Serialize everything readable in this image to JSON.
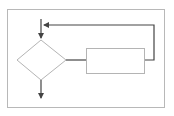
{
  "diagram": {
    "type": "flowchart-loop",
    "colors": {
      "background": "#ffffff",
      "frame": "#b8b8b8",
      "shape_stroke": "#b4b4b4",
      "connector": "#444444"
    },
    "nodes": [
      {
        "id": "decision",
        "shape": "diamond",
        "label": ""
      },
      {
        "id": "process",
        "shape": "rectangle",
        "label": ""
      }
    ],
    "edges": [
      {
        "from": "entry",
        "to": "decision",
        "direction": "down"
      },
      {
        "from": "decision",
        "to": "process",
        "direction": "right"
      },
      {
        "from": "process",
        "to": "entry",
        "direction": "loop-back-left"
      },
      {
        "from": "decision",
        "to": "exit",
        "direction": "down"
      }
    ]
  }
}
